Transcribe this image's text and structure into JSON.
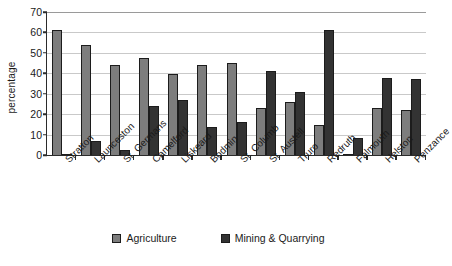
{
  "chart_data": {
    "type": "bar",
    "title": "",
    "xlabel": "",
    "ylabel": "percentage",
    "ylim": [
      0,
      70
    ],
    "ytick_step": 10,
    "yticks": [
      0,
      10,
      20,
      30,
      40,
      50,
      60,
      70
    ],
    "grid": true,
    "legend_position": "bottom",
    "categories": [
      "Stratton",
      "Launceston",
      "St. Germans",
      "Camelford",
      "Liskeard",
      "Bodmin",
      "St. Columb",
      "St. Austell",
      "Truro",
      "Redruth",
      "Falmouth",
      "Helston",
      "Penzance"
    ],
    "series": [
      {
        "name": "Agriculture",
        "color": "#7d7d7d",
        "values": [
          61,
          54,
          44,
          47.5,
          39.5,
          44,
          45,
          23,
          26,
          14.5,
          0,
          23,
          22
        ]
      },
      {
        "name": "Mining & Quarrying",
        "color": "#333333",
        "values": [
          0.5,
          7,
          2.5,
          24,
          27,
          13.5,
          16,
          41,
          31,
          61,
          8.5,
          37.5,
          37
        ]
      }
    ]
  },
  "legend": {
    "items": [
      {
        "label": "Agriculture",
        "color": "#7d7d7d"
      },
      {
        "label": "Mining & Quarrying",
        "color": "#333333"
      }
    ]
  },
  "axis": {
    "y_title": "percentage"
  },
  "colors": {
    "agriculture": "#7d7d7d",
    "mining": "#333333",
    "axis": "#2b2b2b",
    "gridline": "#c9c9c9",
    "background": "#ffffff"
  }
}
